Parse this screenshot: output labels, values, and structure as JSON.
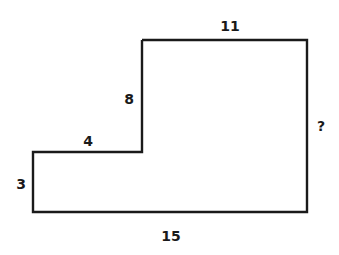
{
  "diagram": {
    "type": "l-shaped-polygon",
    "stroke_color": "#1a1a1a",
    "background": "#ffffff",
    "vertices": [
      [
        142,
        40
      ],
      [
        307,
        40
      ],
      [
        307,
        212
      ],
      [
        33,
        212
      ],
      [
        33,
        152
      ],
      [
        142,
        152
      ]
    ],
    "labels": {
      "top": "11",
      "upper_left_vertical": "8",
      "right": "?",
      "step_horizontal": "4",
      "left": "3",
      "bottom": "15"
    }
  }
}
